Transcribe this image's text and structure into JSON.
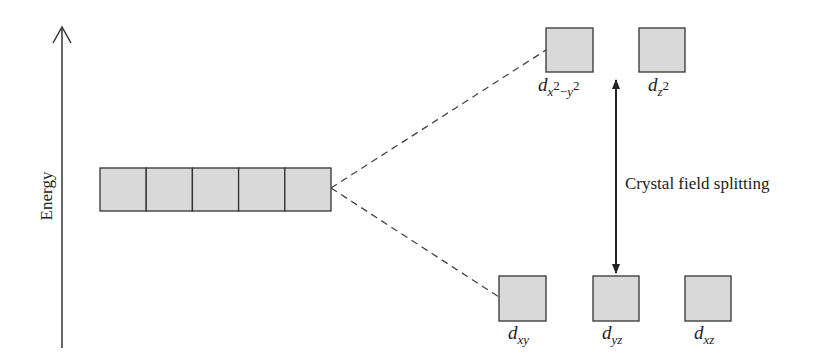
{
  "axis": {
    "label": "Energy"
  },
  "degenerate_set": {
    "count": 5
  },
  "upper_level": {
    "orbitals": [
      {
        "name": "d",
        "subscript": "x",
        "superscript1": "2",
        "minus": "−",
        "sub2": "y",
        "superscript2": "2",
        "label": "dx2−y2"
      },
      {
        "name": "d",
        "subscript": "z",
        "superscript": "2",
        "label": "dz2"
      }
    ]
  },
  "lower_level": {
    "orbitals": [
      {
        "name": "d",
        "subscript": "xy",
        "label": "dxy"
      },
      {
        "name": "d",
        "subscript": "yz",
        "label": "dyz"
      },
      {
        "name": "d",
        "subscript": "xz",
        "label": "dxz"
      }
    ]
  },
  "splitting": {
    "label": "Crystal field splitting"
  },
  "colors": {
    "box_fill": "#d9d9d9",
    "stroke": "#333333"
  }
}
